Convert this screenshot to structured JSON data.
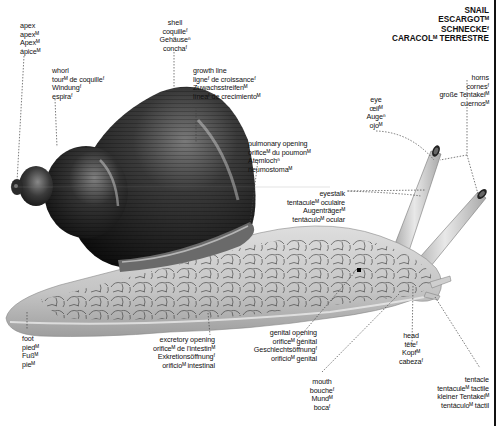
{
  "title": {
    "lines": [
      "SNAIL",
      "ESCARGOTᴹ",
      "SCHNECKEᶠ",
      "CARACOLᴹ TERRESTRE"
    ]
  },
  "labels": {
    "apex": {
      "lines": [
        "apex",
        "apexᴹ",
        "Apexᴹ",
        "ápiceᴹ"
      ]
    },
    "whorl": {
      "lines": [
        "whorl",
        "tourᴹ de coquilleᶠ",
        "Windungᶠ",
        "espiraᶠ"
      ]
    },
    "shell": {
      "lines": [
        "shell",
        "coquilleᶠ",
        "Gehäuseⁿ",
        "conchaᶠ"
      ]
    },
    "growth_line": {
      "lines": [
        "growth line",
        "ligneᶠ de croissanceᶠ",
        "Zuwachsstreifenᴹ",
        "líneaᶠ de crecimientoᴹ"
      ]
    },
    "pulmonary_opening": {
      "lines": [
        "pulmonary opening",
        "orificeᴹ du poumonᴹ",
        "Atemlochⁿ",
        "neumostomaᴹ"
      ]
    },
    "eye": {
      "lines": [
        "eye",
        "œilᴹ",
        "Augeⁿ",
        "ojoᴹ"
      ]
    },
    "horns": {
      "lines": [
        "horns",
        "cornesᶠ",
        "große Tentakelᴹ",
        "cuernosᴹ"
      ]
    },
    "eyestalk": {
      "lines": [
        "eyestalk",
        "tentaculeᴹ oculaire",
        "Augenträgerᴹ",
        "tentáculoᴹ ocular"
      ]
    },
    "foot": {
      "lines": [
        "foot",
        "piedᴹ",
        "Fußᴹ",
        "pieᴹ"
      ]
    },
    "excretory_opening": {
      "lines": [
        "excretory opening",
        "orificeᴹ de l'intestinᴹ",
        "Exkretionsöffnungᶠ",
        "orificioᴹ intestinal"
      ]
    },
    "genital_opening": {
      "lines": [
        "genital opening",
        "orificeᴹ génital",
        "Geschlechtsöffnungᶠ",
        "orificioᴹ genital"
      ]
    },
    "mouth": {
      "lines": [
        "mouth",
        "boucheᶠ",
        "Mundᴹ",
        "bocaᶠ"
      ]
    },
    "head": {
      "lines": [
        "head",
        "têteᶠ",
        "Kopfᴹ",
        "cabezaᶠ"
      ]
    },
    "tentacle": {
      "lines": [
        "tentacle",
        "tentaculeᴹ tactile",
        "kleiner Tentakelᴹ",
        "tentáculoᴹ táctil"
      ]
    }
  },
  "colors": {
    "shell_dark": "#1c1c1c",
    "shell_mid": "#4a4a4a",
    "shell_highlight": "#9a9a9a",
    "body_light": "#d9d9d9",
    "body_mid": "#b5b5b5",
    "leader_line": "#444444",
    "frame": "#111111"
  }
}
